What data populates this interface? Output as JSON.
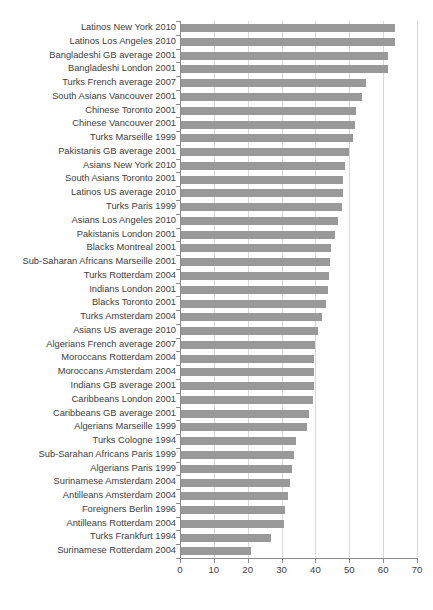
{
  "chart_data": {
    "type": "bar",
    "orientation": "horizontal",
    "title": "",
    "xlabel": "",
    "ylabel": "",
    "xlim": [
      0,
      70
    ],
    "xticks": [
      0,
      10,
      20,
      30,
      40,
      50,
      60,
      70
    ],
    "grid": true,
    "legend": "none",
    "bar_color": "#999999",
    "gridline_color": "#d9d9d9",
    "axis_color": "#8c8c8c",
    "categories": [
      "Latinos New York 2010",
      "Latinos Los Angeles 2010",
      "Bangladeshi GB average 2001",
      "Bangladeshi London 2001",
      "Turks French average 2007",
      "South Asians Vancouver 2001",
      "Chinese Toronto 2001",
      "Chinese Vancouver 2001",
      "Turks Marseille 1999",
      "Pakistanis GB average 2001",
      "Asians New York 2010",
      "South Asians Toronto 2001",
      "Latinos US average 2010",
      "Turks Paris 1999",
      "Asians Los Angeles 2010",
      "Pakistanis London 2001",
      "Blacks Montreal 2001",
      "Sub-Saharan Africans Marseille 2001",
      "Turks Rotterdam 2004",
      "Indians London 2001",
      "Blacks Toronto 2001",
      "Turks Amsterdam 2004",
      "Asians US average 2010",
      "Algerians French average 2007",
      "Moroccans Rotterdam 2004",
      "Moroccans Amsterdam 2004",
      "Indians GB average 2001",
      "Caribbeans London 2001",
      "Caribbeans GB average 2001",
      "Algerians Marseille 1999",
      "Turks Cologne 1994",
      "Sub-Sarahan Africans Paris 1999",
      "Algerians Paris 1999",
      "Surinamese Amsterdam 2004",
      "Antilleans Amsterdam 2004",
      "Foreigners Berlin 1996",
      "Antilleans Rotterdam 2004",
      "Turks Frankfurt 1994",
      "Surinamese Rotterdam 2004"
    ],
    "values": [
      63.5,
      63.5,
      61.5,
      61.4,
      54.8,
      53.7,
      52.0,
      51.6,
      51.0,
      49.8,
      48.8,
      48.2,
      48.0,
      47.8,
      46.8,
      45.8,
      44.6,
      44.2,
      44.0,
      43.6,
      43.0,
      41.8,
      40.8,
      39.8,
      39.7,
      39.6,
      39.5,
      39.4,
      38.2,
      37.6,
      34.2,
      33.6,
      33.0,
      32.4,
      32.0,
      31.0,
      30.8,
      27.0,
      21.0
    ]
  }
}
